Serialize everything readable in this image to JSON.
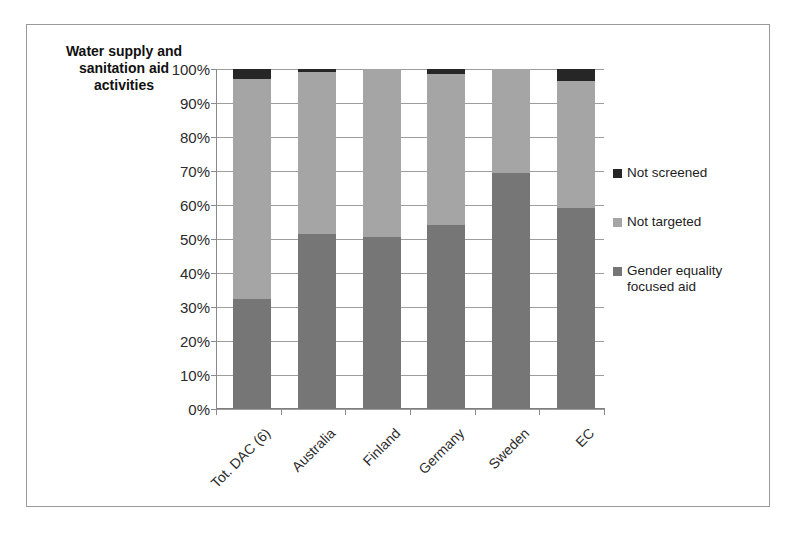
{
  "chart_data": {
    "type": "bar",
    "subtype": "stacked-100-percent",
    "title": "Water supply and\nsanitation aid\nactivities",
    "xlabel": "",
    "ylabel": "",
    "ylim": [
      0,
      100
    ],
    "ytick_labels": [
      "100%",
      "90%",
      "80%",
      "70%",
      "60%",
      "50%",
      "40%",
      "30%",
      "20%",
      "10%",
      "0%"
    ],
    "ytick_values": [
      100,
      90,
      80,
      70,
      60,
      50,
      40,
      30,
      20,
      10,
      0
    ],
    "grid": true,
    "legend_position": "right",
    "categories": [
      "Tot. DAC (6)",
      "Australia",
      "Finland",
      "Germany",
      "Sweden",
      "EC"
    ],
    "series": [
      {
        "name": "Gender equality focused aid",
        "color": "#767676",
        "values": [
          32.5,
          51.5,
          50.5,
          54.0,
          69.5,
          59.0
        ]
      },
      {
        "name": "Not targeted",
        "color": "#a5a5a5",
        "values": [
          64.5,
          47.5,
          49.5,
          44.5,
          30.5,
          37.5
        ]
      },
      {
        "name": "Not screened",
        "color": "#262626",
        "values": [
          3.0,
          1.0,
          0.0,
          1.5,
          0.0,
          3.5
        ]
      }
    ]
  },
  "legend": {
    "items": [
      {
        "label": "Not screened",
        "color": "#262626"
      },
      {
        "label": "Not targeted",
        "color": "#a5a5a5"
      },
      {
        "label": "Gender equality\nfocused aid",
        "color": "#767676"
      }
    ]
  },
  "colors": {
    "frame_border": "#9a9a9a",
    "gridline": "#9d9d9d",
    "axis": "#8a8a8a",
    "text": "#2b2b2b",
    "background": "#ffffff"
  }
}
